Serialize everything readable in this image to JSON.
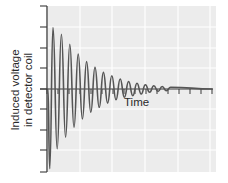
{
  "chart_data": {
    "type": "line",
    "title": "",
    "xlabel": "Time",
    "ylabel": "Induced voltage\nin detector coil",
    "ylabel_lines": [
      "Induced voltage",
      "in detector coil"
    ],
    "grid": true,
    "legend": null,
    "x_ticks_labeled": false,
    "y_ticks_labeled": false,
    "ylim": [
      -1,
      1
    ],
    "xlim": [
      0,
      1
    ],
    "series": [
      {
        "name": "Induced voltage",
        "model": "A * exp(-t/tau) * sin(2*pi*f*t) (approx.)",
        "peaks": [
          {
            "x": 0.03,
            "y": 0.74
          },
          {
            "x": 0.08,
            "y": 0.66
          },
          {
            "x": 0.13,
            "y": 0.54
          },
          {
            "x": 0.18,
            "y": 0.42
          },
          {
            "x": 0.23,
            "y": 0.33
          },
          {
            "x": 0.28,
            "y": 0.26
          },
          {
            "x": 0.33,
            "y": 0.2
          },
          {
            "x": 0.38,
            "y": 0.16
          },
          {
            "x": 0.43,
            "y": 0.12
          },
          {
            "x": 0.48,
            "y": 0.09
          },
          {
            "x": 0.53,
            "y": 0.07
          },
          {
            "x": 0.58,
            "y": 0.05
          },
          {
            "x": 0.63,
            "y": 0.04
          },
          {
            "x": 0.68,
            "y": 0.03
          },
          {
            "x": 0.73,
            "y": 0.02
          }
        ],
        "troughs": [
          {
            "x": 0.01,
            "y": -0.96
          },
          {
            "x": 0.055,
            "y": -0.72
          },
          {
            "x": 0.105,
            "y": -0.58
          },
          {
            "x": 0.155,
            "y": -0.46
          },
          {
            "x": 0.205,
            "y": -0.36
          },
          {
            "x": 0.255,
            "y": -0.28
          },
          {
            "x": 0.305,
            "y": -0.22
          },
          {
            "x": 0.355,
            "y": -0.17
          },
          {
            "x": 0.405,
            "y": -0.13
          },
          {
            "x": 0.455,
            "y": -0.1
          },
          {
            "x": 0.505,
            "y": -0.08
          },
          {
            "x": 0.555,
            "y": -0.06
          },
          {
            "x": 0.605,
            "y": -0.04
          },
          {
            "x": 0.655,
            "y": -0.03
          },
          {
            "x": 0.705,
            "y": -0.02
          }
        ]
      }
    ],
    "colors": {
      "plot_background": "#ececec",
      "gridline": "#ffffff",
      "axis": "#3a3a3a",
      "signal": "#555555"
    }
  }
}
